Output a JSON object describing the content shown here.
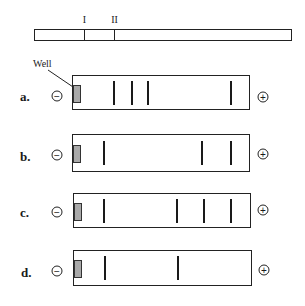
{
  "reference_bar": {
    "markers": [
      {
        "label": "I",
        "x": 84
      },
      {
        "label": "II",
        "x": 114
      }
    ]
  },
  "well_label": "Well",
  "electrodes": {
    "negative": "−",
    "positive": "+"
  },
  "gels": [
    {
      "label": "a.",
      "top": 75,
      "bands_x": [
        114,
        132,
        148,
        231
      ]
    },
    {
      "label": "b.",
      "top": 134,
      "bands_x": [
        104,
        202,
        231
      ]
    },
    {
      "label": "c.",
      "top": 193,
      "bands_x": [
        104,
        177,
        204,
        231
      ]
    },
    {
      "label": "d.",
      "top": 250,
      "bands_x": [
        105,
        178
      ]
    }
  ],
  "colors": {
    "well_fill": "#a9a9a9",
    "line": "#222222"
  }
}
